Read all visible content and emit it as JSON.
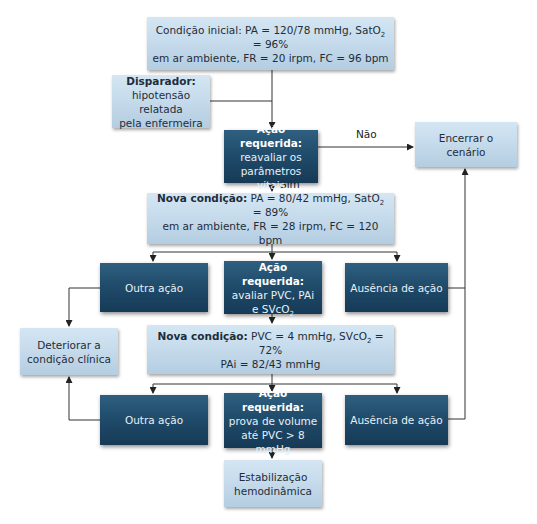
{
  "nodes": {
    "start": {
      "label": "Condição inicial:",
      "line1_rest": "PA = 120/78 mmHg, SatO",
      "sub": "2",
      "line1_end": " = 96%",
      "line2": "em ar ambiente, FR = 20 irpm, FC = 96 bpm"
    },
    "trigger": {
      "head": "Disparador:",
      "line1": "hipotensão relatada",
      "line2": "pela enfermeira"
    },
    "action1": {
      "head": "Ação requerida:",
      "line1": "reavaliar os",
      "line2": "parâmetros vitais"
    },
    "end": {
      "label": "Encerrar o cenário"
    },
    "cond2": {
      "head": "Nova condição:",
      "line1_rest": " PA = 80/42 mmHg, SatO",
      "sub": "2",
      "line1_end": " = 89%",
      "line2": "em ar ambiente, FR = 28 irpm, FC = 120 bpm"
    },
    "other1": {
      "label": "Outra ação"
    },
    "action2": {
      "head": "Ação requerida:",
      "line1": "avaliar PVC, PAi",
      "line2_pre": "e SVcO",
      "sub": "2"
    },
    "absence1": {
      "label": "Ausência de ação"
    },
    "deteriorate": {
      "line1": "Deteriorar a",
      "line2": "condição clínica"
    },
    "cond3": {
      "head": "Nova condição:",
      "line1_rest": " PVC = 4 mmHg, SVcO",
      "sub": "2",
      "line1_end": " = 72%",
      "line2": "PAi = 82/43 mmHg"
    },
    "other2": {
      "label": "Outra ação"
    },
    "action3": {
      "head": "Ação requerida:",
      "line1": "prova de volume",
      "line2": "até PVC > 8 mmHg"
    },
    "absence2": {
      "label": "Ausência de ação"
    },
    "stabilize": {
      "line1": "Estabilização",
      "line2": "hemodinâmica"
    }
  },
  "edges": {
    "no_label": "Não",
    "yes_label": "Sim"
  },
  "colors": {
    "light_box": "#c3d9ea",
    "dark_box": "#1f4a69",
    "line": "#333333"
  }
}
